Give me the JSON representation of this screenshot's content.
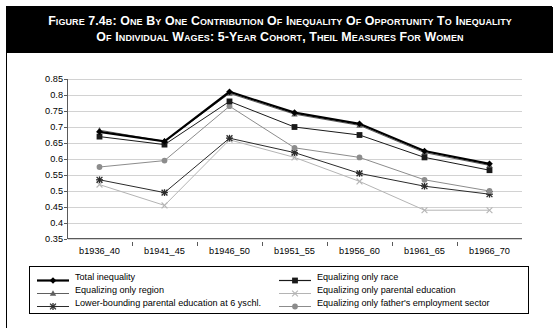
{
  "figure": {
    "label": "Figure 7.4b:",
    "title_line1": "One by One Contribution of Inequality of Opportunity to Inequality",
    "title_line2": "of Individual Wages: 5-year Cohort, Theil Measures for Women",
    "full_title": "Figure 7.4b: One by One Contribution of Inequality of Opportunity to Inequality of Individual Wages: 5-year Cohort, Theil Measures for Women"
  },
  "colors": {
    "banner_bg": "#000000",
    "banner_text": "#ffffff",
    "plot_bg": "#ffffff",
    "gridline": "#d2d2d2",
    "axis": "#5a5a5a",
    "series_total": "#000000",
    "series_region": "#5f5f5f",
    "series_lower_bounding": "#2b2b2b",
    "series_race": "#1a1a1a",
    "series_parental_education": "#b4b4b4",
    "series_father_sector": "#8c8c8c"
  },
  "chart_data": {
    "type": "line",
    "title": "One by One Contribution of Inequality of Opportunity to Inequality of Individual Wages: 5-year Cohort, Theil Measures for Women",
    "xlabel": "",
    "ylabel": "",
    "ylim": [
      0.35,
      0.85
    ],
    "ytick_step": 0.05,
    "yticks": [
      "0.85",
      "0.8",
      "0.75",
      "0.7",
      "0.65",
      "0.6",
      "0.55",
      "0.5",
      "0.45",
      "0.4",
      "0.35"
    ],
    "grid": true,
    "legend_position": "bottom",
    "categories": [
      "b1936_40",
      "b1941_45",
      "b1946_50",
      "b1951_55",
      "b1956_60",
      "b1961_65",
      "b1966_70"
    ],
    "series": [
      {
        "name": "Total inequality",
        "marker": "diamond",
        "color": "#000000",
        "line_width": 2.2,
        "values": [
          0.685,
          0.655,
          0.81,
          0.745,
          0.71,
          0.625,
          0.585
        ]
      },
      {
        "name": "Equalizing only race",
        "marker": "square",
        "color": "#1a1a1a",
        "line_width": 1.0,
        "values": [
          0.67,
          0.645,
          0.78,
          0.7,
          0.675,
          0.605,
          0.565
        ]
      },
      {
        "name": "Equalizing only region",
        "marker": "triangle",
        "color": "#5f5f5f",
        "line_width": 1.0,
        "values": [
          0.69,
          0.655,
          0.805,
          0.74,
          0.705,
          0.62,
          0.58
        ]
      },
      {
        "name": "Equalizing only parental education",
        "marker": "x",
        "color": "#b4b4b4",
        "line_width": 1.0,
        "values": [
          0.52,
          0.455,
          0.66,
          0.605,
          0.53,
          0.44,
          0.44
        ]
      },
      {
        "name": "Lower-bounding parental education at 6 yschl.",
        "marker": "asterisk",
        "color": "#2b2b2b",
        "line_width": 1.0,
        "values": [
          0.535,
          0.495,
          0.665,
          0.62,
          0.555,
          0.515,
          0.49
        ]
      },
      {
        "name": "Equalizing only father's employment sector",
        "marker": "circle",
        "color": "#8c8c8c",
        "line_width": 1.0,
        "values": [
          0.575,
          0.595,
          0.765,
          0.635,
          0.605,
          0.535,
          0.5
        ]
      }
    ]
  },
  "legend": {
    "items": [
      {
        "label": "Total inequality",
        "marker": "diamond",
        "color": "#000000",
        "line_width": 2.2,
        "column": 0
      },
      {
        "label": "Equalizing only race",
        "marker": "square",
        "color": "#1a1a1a",
        "line_width": 1.2,
        "column": 1
      },
      {
        "label": "Equalizing only region",
        "marker": "triangle",
        "color": "#5f5f5f",
        "line_width": 1.0,
        "column": 0
      },
      {
        "label": "Equalizing only parental education",
        "marker": "x",
        "color": "#b4b4b4",
        "line_width": 1.0,
        "column": 1
      },
      {
        "label": "Lower-bounding parental education at 6 yschl.",
        "marker": "asterisk",
        "color": "#2b2b2b",
        "line_width": 1.0,
        "column": 0
      },
      {
        "label": "Equalizing only father's employment sector",
        "marker": "circle",
        "color": "#8c8c8c",
        "line_width": 1.0,
        "column": 1
      }
    ]
  }
}
